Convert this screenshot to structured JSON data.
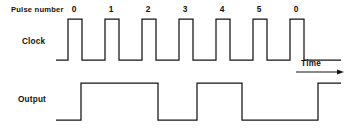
{
  "figure": {
    "title_text": "",
    "background_color": "#ffffff",
    "line_color": "#141414",
    "text_color": "#111111",
    "width": 351,
    "height": 133
  },
  "labels": {
    "pulse_number_header": "Pulse number",
    "clock_label": "Clock",
    "output_label": "Output",
    "time_label": "Time"
  },
  "pulse_numbers": [
    {
      "text": "0",
      "x": 74
    },
    {
      "text": "1",
      "x": 111
    },
    {
      "text": "2",
      "x": 148
    },
    {
      "text": "3",
      "x": 185
    },
    {
      "text": "4",
      "x": 222
    },
    {
      "text": "5",
      "x": 259
    },
    {
      "text": "0",
      "x": 296
    }
  ],
  "chart_data": {
    "type": "line",
    "xlabel": "Time",
    "ylabel": "",
    "grid": false,
    "legend": "none",
    "x_axis": {
      "start_px": 56,
      "end_px": 341,
      "unit": "clock cycle",
      "cycle_width_px": 37,
      "tick_labels": [
        "0",
        "1",
        "2",
        "3",
        "4",
        "5",
        "0"
      ]
    },
    "series": [
      {
        "name": "Clock",
        "type": "digital-square-wave",
        "levels": {
          "low_y": 60,
          "high_y": 19
        },
        "description": "Seven positive clock pulses, period 37 px, high time 14 px",
        "points": [
          [
            56,
            60
          ],
          [
            68,
            60
          ],
          [
            68,
            19
          ],
          [
            82,
            19
          ],
          [
            82,
            60
          ],
          [
            105,
            60
          ],
          [
            105,
            19
          ],
          [
            119,
            19
          ],
          [
            119,
            60
          ],
          [
            142,
            60
          ],
          [
            142,
            19
          ],
          [
            156,
            19
          ],
          [
            156,
            60
          ],
          [
            179,
            60
          ],
          [
            179,
            19
          ],
          [
            193,
            19
          ],
          [
            193,
            60
          ],
          [
            216,
            60
          ],
          [
            216,
            19
          ],
          [
            230,
            19
          ],
          [
            230,
            60
          ],
          [
            253,
            60
          ],
          [
            253,
            19
          ],
          [
            267,
            19
          ],
          [
            267,
            60
          ],
          [
            290,
            60
          ],
          [
            290,
            19
          ],
          [
            304,
            19
          ],
          [
            304,
            60
          ],
          [
            341,
            60
          ]
        ]
      },
      {
        "name": "Output",
        "type": "digital-square-wave",
        "levels": {
          "low_y": 120,
          "high_y": 83
        },
        "description": "Output toggles on clock falling edges producing wide high intervals",
        "points": [
          [
            56,
            120
          ],
          [
            81,
            120
          ],
          [
            81,
            83
          ],
          [
            158,
            83
          ],
          [
            158,
            120
          ],
          [
            197,
            120
          ],
          [
            197,
            83
          ],
          [
            242,
            83
          ],
          [
            242,
            120
          ],
          [
            318,
            120
          ],
          [
            318,
            83
          ],
          [
            341,
            83
          ]
        ]
      }
    ],
    "time_arrow": {
      "label": "Time",
      "x_start": 296,
      "x_end": 344,
      "y": 72
    }
  }
}
